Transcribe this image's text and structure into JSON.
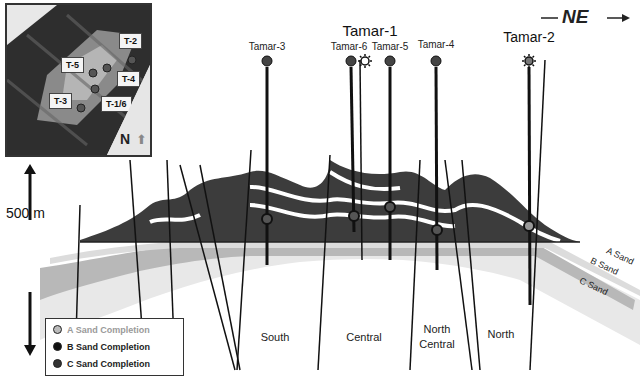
{
  "direction": {
    "label": "NE",
    "arrow": "arrow-right"
  },
  "wells": {
    "tamar1_group_label": "Tamar-1",
    "items": [
      {
        "name": "Tamar-3",
        "x": 267,
        "symbol": "dot"
      },
      {
        "name": "Tamar-6",
        "x": 351,
        "symbol": "dot"
      },
      {
        "name": "Tamar-1",
        "x": 364,
        "symbol": "gas"
      },
      {
        "name": "Tamar-5",
        "x": 390,
        "symbol": "dot"
      },
      {
        "name": "Tamar-4",
        "x": 436,
        "symbol": "dot"
      },
      {
        "name": "Tamar-2",
        "x": 529,
        "symbol": "gas"
      }
    ]
  },
  "scale": {
    "label": "500 m"
  },
  "zones": [
    {
      "label": "South"
    },
    {
      "label": "Central"
    },
    {
      "label": "North Central",
      "line1": "North",
      "line2": "Central"
    },
    {
      "label": "North"
    }
  ],
  "sands": [
    {
      "label": "A Sand"
    },
    {
      "label": "B Sand"
    },
    {
      "label": "C Sand"
    }
  ],
  "legend": {
    "items": [
      {
        "label": "A Sand Completion",
        "color": "#9a9a9a",
        "text_color": "#9a9a9a"
      },
      {
        "label": "B Sand Completion",
        "color": "#222222",
        "text_color": "#222222"
      },
      {
        "label": "C Sand Completion",
        "color": "#333333",
        "text_color": "#222222"
      }
    ]
  },
  "inset_map": {
    "north_label": "N",
    "wells": [
      {
        "label": "T-2"
      },
      {
        "label": "T-5"
      },
      {
        "label": "T-4"
      },
      {
        "label": "T-3"
      },
      {
        "label": "T-1/6"
      }
    ]
  },
  "colors": {
    "reservoir_dark": "#3a3a3a",
    "sand_light": "#e6e6e6",
    "sand_mid": "#b4b4b4",
    "fault": "#111111"
  }
}
